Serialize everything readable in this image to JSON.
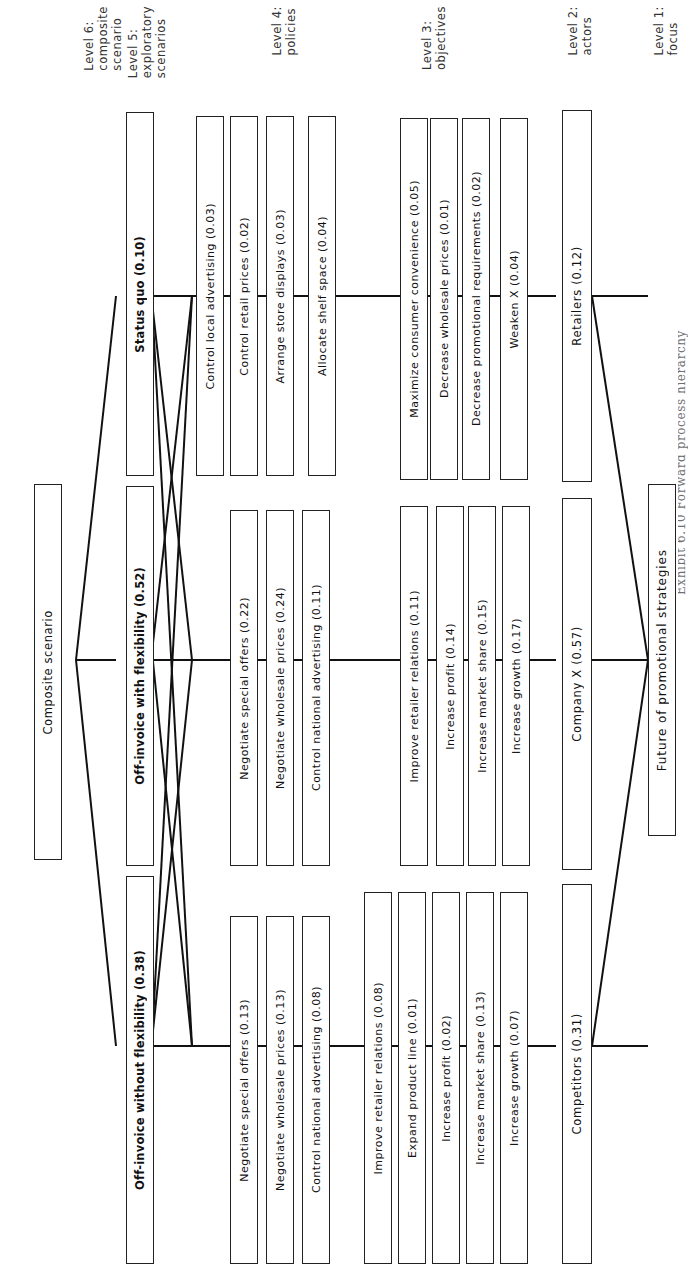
{
  "figure": {
    "caption": "Exhibit 6.10  Forward process hierarchy",
    "orientation": "rotated-90",
    "width": 696,
    "height": 1280
  },
  "levels": [
    {
      "id": "level-1",
      "label": "Level 1:\nfocus"
    },
    {
      "id": "level-2",
      "label": "Level 2:\nactors"
    },
    {
      "id": "level-3",
      "label": "Level 3:\nobjectives"
    },
    {
      "id": "level-4",
      "label": "Level 4:\npolicies"
    },
    {
      "id": "level-5",
      "label": "Level 5:\nexploratory\nscenarios"
    },
    {
      "id": "level-6",
      "label": "Level 6:\ncomposite\nscenario"
    }
  ],
  "nodes": {
    "focus": [
      {
        "id": "n-focus",
        "label": "Future of promotional strategies"
      }
    ],
    "actors": [
      {
        "id": "n-retailers",
        "label": "Retailers (0.12)"
      },
      {
        "id": "n-company-x",
        "label": "Company X (0.57)"
      },
      {
        "id": "n-competitors",
        "label": "Competitors (0.31)"
      }
    ],
    "objectives": [
      {
        "id": "o-max-consumer-convenience",
        "label": "Maximize consumer convenience (0.05)"
      },
      {
        "id": "o-decrease-wholesale-prices",
        "label": "Decrease wholesale prices (0.01)"
      },
      {
        "id": "o-decrease-promotional-requirements",
        "label": "Decrease promotional requirements (0.02)"
      },
      {
        "id": "o-weaken-x",
        "label": "Weaken X (0.04)"
      },
      {
        "id": "o-improve-retailer-relations-cx",
        "label": "Improve retailer relations (0.11)"
      },
      {
        "id": "o-increase-profit-cx",
        "label": "Increase profit (0.14)"
      },
      {
        "id": "o-increase-market-share-cx",
        "label": "Increase market share (0.15)"
      },
      {
        "id": "o-increase-growth-cx",
        "label": "Increase growth (0.17)"
      },
      {
        "id": "o-improve-retailer-relations-comp",
        "label": "Improve retailer relations (0.08)"
      },
      {
        "id": "o-expand-product-line",
        "label": "Expand product line (0.01)"
      },
      {
        "id": "o-increase-profit-comp",
        "label": "Increase profit (0.02)"
      },
      {
        "id": "o-increase-market-share-comp",
        "label": "Increase market share (0.13)"
      },
      {
        "id": "o-increase-growth-comp",
        "label": "Increase growth (0.07)"
      }
    ],
    "policies": [
      {
        "id": "p-allocate-shelf-space",
        "label": "Allocate shelf space (0.04)"
      },
      {
        "id": "p-arrange-store-displays",
        "label": "Arrange store displays (0.03)"
      },
      {
        "id": "p-control-retail-prices",
        "label": "Control retail prices (0.02)"
      },
      {
        "id": "p-control-local-advertising",
        "label": "Control local advertising (0.03)"
      },
      {
        "id": "p-control-national-advertising-cx",
        "label": "Control national advertising (0.11)"
      },
      {
        "id": "p-negotiate-wholesale-prices-cx",
        "label": "Negotiate wholesale prices (0.24)"
      },
      {
        "id": "p-negotiate-special-offers-cx",
        "label": "Negotiate special offers (0.22)"
      },
      {
        "id": "p-control-national-advertising-comp",
        "label": "Control national advertising (0.08)"
      },
      {
        "id": "p-negotiate-wholesale-prices-comp",
        "label": "Negotiate wholesale prices (0.13)"
      },
      {
        "id": "p-negotiate-special-offers-comp",
        "label": "Negotiate special offers (0.13)"
      }
    ],
    "scenarios": [
      {
        "id": "s-status-quo",
        "label": "Status quo (0.10)"
      },
      {
        "id": "s-off-invoice-with-flexibility",
        "label": "Off-invoice with flexibility (0.52)"
      },
      {
        "id": "s-off-invoice-without-flexibility",
        "label": "Off-invoice without flexibility (0.38)"
      }
    ],
    "composite": [
      {
        "id": "c-composite",
        "label": "Composite scenario"
      }
    ]
  },
  "style": {
    "box_border": "#222222",
    "link_color": "#111111",
    "page_background": "#ffffff",
    "label_color": "#333333"
  }
}
